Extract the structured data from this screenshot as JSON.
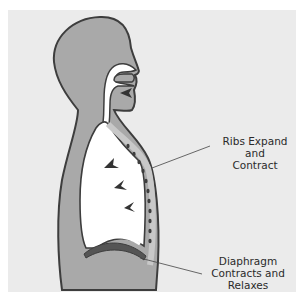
{
  "figure": {
    "type": "anatomical-diagram",
    "colors": {
      "panel": "#ebebeb",
      "body_fill": "#a9a9a9",
      "outline": "#3d3d3d",
      "airway": "#ffffff",
      "lung_fill": "#ffffff",
      "arrow": "#333333"
    }
  },
  "labels": {
    "ribs": {
      "line1": "Ribs Expand and",
      "line2": "Contract"
    },
    "diaphragm": {
      "line1": "Diaphragm",
      "line2": "Contracts and",
      "line3": "Relaxes"
    }
  },
  "arrows": [
    {
      "name": "air-intake",
      "x": 126,
      "y": 93
    },
    {
      "name": "lung-arrow-1",
      "x": 110,
      "y": 165
    },
    {
      "name": "lung-arrow-2",
      "x": 122,
      "y": 185
    },
    {
      "name": "lung-arrow-3",
      "x": 132,
      "y": 206
    }
  ]
}
